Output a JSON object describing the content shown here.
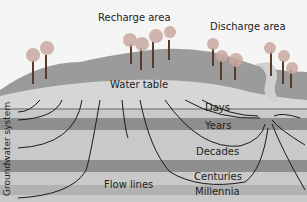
{
  "diagram": {
    "labels": {
      "recharge": "Recharge area",
      "discharge": "Discharge area",
      "water_table": "Water table",
      "days": "Days",
      "years": "Years",
      "decades": "Decades",
      "centuries": "Centuries",
      "millennia": "Millennia",
      "flow_lines": "Flow lines",
      "system": "Groundwater system"
    },
    "colors": {
      "sky": "#f4f4f4",
      "hill": "#9a9a9a",
      "water_table_band": "#d4d4d4",
      "layer_light": "#c8c8c8",
      "layer_dark": "#8f8f8f",
      "flow_line": "#1a1a1a"
    }
  }
}
